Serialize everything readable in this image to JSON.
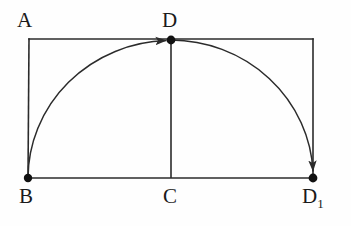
{
  "figure": {
    "type": "geometry-diagram",
    "background_color": "#fefefe",
    "stroke_color": "#2b2b2b",
    "label_color": "#1a1a1a"
  },
  "labels": {
    "a": "A",
    "d": "D",
    "b": "B",
    "c": "C",
    "d1_base": "D",
    "d1_sub": "1"
  },
  "points": {
    "A": {
      "name": "A",
      "x": 29,
      "y": 39,
      "dot": false
    },
    "D": {
      "name": "D",
      "x": 171,
      "y": 40,
      "dot": true
    },
    "TR": {
      "name": "",
      "x": 313,
      "y": 39,
      "dot": false
    },
    "B": {
      "name": "B",
      "x": 28,
      "y": 178,
      "dot": true
    },
    "C": {
      "name": "C",
      "x": 171,
      "y": 178,
      "dot": false
    },
    "D1": {
      "name": "D1",
      "x": 313,
      "y": 178,
      "dot": true
    }
  },
  "segments": [
    {
      "name": "top-edge",
      "x1": 29,
      "y1": 39,
      "x2": 313,
      "y2": 39
    },
    {
      "name": "left-edge",
      "x1": 29,
      "y1": 39,
      "x2": 28,
      "y2": 178
    },
    {
      "name": "right-edge",
      "x1": 313,
      "y1": 39,
      "x2": 313,
      "y2": 178
    },
    {
      "name": "bottom-edge",
      "x1": 28,
      "y1": 178,
      "x2": 313,
      "y2": 178
    },
    {
      "name": "altitude-d-c",
      "x1": 171,
      "y1": 40,
      "x2": 171,
      "y2": 178
    }
  ],
  "arc": {
    "name": "elliptical-arc-b-d-d1",
    "start": {
      "x": 28,
      "y": 178
    },
    "apex": {
      "x": 171,
      "y": 40
    },
    "end": {
      "x": 313,
      "y": 178
    },
    "rx": 143,
    "ry": 138,
    "arrowhead_at_apex": "right",
    "arrowhead_at_end": "down"
  },
  "style": {
    "stroke_width": 1.6,
    "dot_radius": 4.2,
    "label_font_size": 21,
    "subscript_font_size": 13
  }
}
